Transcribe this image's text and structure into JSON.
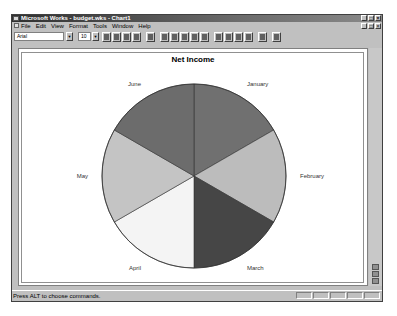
{
  "window": {
    "title": "Microsoft Works - budget.wks - Chart1",
    "title_buttons": [
      "_",
      "□",
      "×"
    ],
    "doc_buttons": [
      "_",
      "□",
      "×"
    ]
  },
  "menu": {
    "items": [
      "File",
      "Edit",
      "View",
      "Format",
      "Tools",
      "Window",
      "Help"
    ]
  },
  "toolbar": {
    "font_name": "Arial",
    "font_size": "10",
    "buttons": [
      "new-icon",
      "save-icon",
      "print-icon",
      "print-preview-icon",
      "copy-icon",
      "bar-chart-icon",
      "line-chart-icon",
      "pie-chart-icon",
      "stacked-line-icon",
      "3d-bar-icon",
      "3d-pie-icon",
      "3d-area-icon",
      "xy-chart-icon",
      "combination-chart-icon",
      "go-to-spreadsheet-icon",
      "help-icon"
    ]
  },
  "status": {
    "text": "Press ALT to choose commands."
  },
  "chart_data": {
    "type": "pie",
    "title": "Net Income",
    "categories": [
      "January",
      "February",
      "March",
      "April",
      "May",
      "June"
    ],
    "values": [
      1,
      1,
      1,
      1,
      1,
      1
    ],
    "colors": [
      "#707070",
      "#bcbcbc",
      "#464646",
      "#f4f4f4",
      "#c4c4c4",
      "#6c6c6c"
    ],
    "start_angle_deg": 0,
    "direction": "clockwise",
    "legend": "none",
    "labels": "outside-slices"
  }
}
